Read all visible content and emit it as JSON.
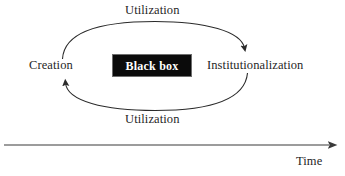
{
  "figure": {
    "type": "cycle-diagram",
    "background_color": "#ffffff",
    "line_color": "#2b2b2b",
    "text_color": "#1f1f1f"
  },
  "cycle": {
    "top_arrow_label": "Utilization",
    "bottom_arrow_label": "Utilization",
    "left_node_label": "Creation",
    "right_node_label": "Institutionalization",
    "center_box": {
      "label": "Black box",
      "fill_color": "#0b0b0b",
      "text_color": "#ffffff"
    }
  },
  "axis": {
    "label": "Time",
    "direction": "rightward"
  }
}
